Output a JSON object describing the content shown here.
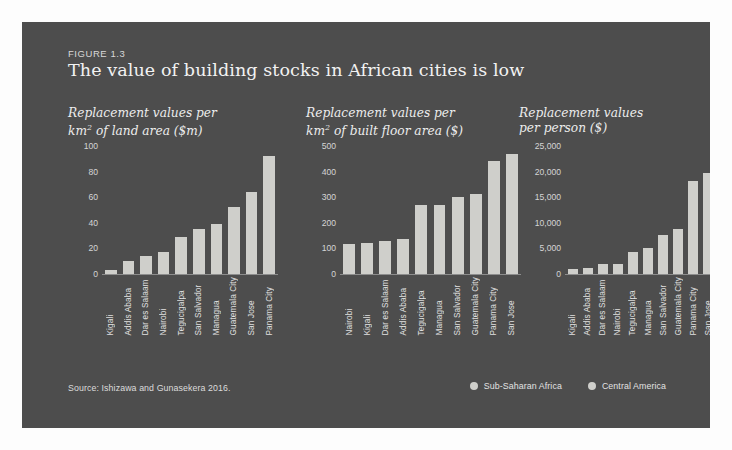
{
  "figure": {
    "label": "FIGURE 1.3",
    "title": "The value of building stocks in African cities is low",
    "source": "Source: Ishizawa and Gunasekera 2016.",
    "panel_color": "#4d4d4d",
    "bar_color": "#cfcfcb"
  },
  "legend": {
    "position": "bottom-right",
    "items": [
      {
        "label": "Sub-Saharan Africa",
        "color": "#cfcfcb"
      },
      {
        "label": "Central America",
        "color": "#cfcfcb"
      }
    ]
  },
  "chart_data": [
    {
      "type": "bar",
      "title": "Replacement values per km² of land area ($m)",
      "title_line1": "Replacement values per",
      "title_line2_pre": "km",
      "title_line2_sup": "2",
      "title_line2_post": " of land area ($m)",
      "xlabel": "",
      "ylabel": "",
      "ylim": [
        0,
        100
      ],
      "yticks": [
        0,
        20,
        40,
        60,
        80,
        100
      ],
      "ytick_labels": [
        "0",
        "20",
        "40",
        "60",
        "80",
        "100"
      ],
      "grid": false,
      "categories": [
        "Kigali",
        "Addis Ababa",
        "Dar es Salaam",
        "Nairobi",
        "Tegucigalpa",
        "San Salvador",
        "Managua",
        "Guatemala City",
        "San Jose",
        "Panama City"
      ],
      "values": [
        3,
        10,
        14,
        17,
        29,
        35,
        39,
        52,
        64,
        92
      ],
      "regions": [
        "Sub-Saharan Africa",
        "Sub-Saharan Africa",
        "Sub-Saharan Africa",
        "Sub-Saharan Africa",
        "Central America",
        "Central America",
        "Central America",
        "Central America",
        "Central America",
        "Central America"
      ]
    },
    {
      "type": "bar",
      "title": "Replacement values per km² of built floor area ($)",
      "title_line1": "Replacement values per",
      "title_line2_pre": "km",
      "title_line2_sup": "2",
      "title_line2_post": " of built floor area ($)",
      "xlabel": "",
      "ylabel": "",
      "ylim": [
        0,
        500
      ],
      "yticks": [
        0,
        100,
        200,
        300,
        400,
        500
      ],
      "ytick_labels": [
        "0",
        "100",
        "200",
        "300",
        "400",
        "500"
      ],
      "grid": false,
      "categories": [
        "Nairobi",
        "Kigali",
        "Dar es Salaam",
        "Addis Ababa",
        "Tegucigalpa",
        "Managua",
        "San Salvador",
        "Guatemala City",
        "Panama City",
        "San Jose"
      ],
      "values": [
        118,
        120,
        130,
        137,
        268,
        270,
        300,
        313,
        440,
        468
      ],
      "regions": [
        "Sub-Saharan Africa",
        "Sub-Saharan Africa",
        "Sub-Saharan Africa",
        "Sub-Saharan Africa",
        "Central America",
        "Central America",
        "Central America",
        "Central America",
        "Central America",
        "Central America"
      ]
    },
    {
      "type": "bar",
      "title": "Replacement values per person ($)",
      "title_line1": "Replacement values",
      "title_line2_pre": "per person ($)",
      "title_line2_sup": "",
      "title_line2_post": "",
      "xlabel": "",
      "ylabel": "",
      "ylim": [
        0,
        25000
      ],
      "yticks": [
        0,
        5000,
        10000,
        15000,
        20000,
        25000
      ],
      "ytick_labels": [
        "0",
        "5,000",
        "10,000",
        "15,000",
        "20,000",
        "25,000"
      ],
      "grid": false,
      "categories": [
        "Kigali",
        "Addis Ababa",
        "Dar es Salaam",
        "Nairobi",
        "Tegucigalpa",
        "Managua",
        "San Salvador",
        "Guatemala City",
        "Panama City",
        "San Jose"
      ],
      "values": [
        1000,
        1200,
        1900,
        2000,
        4300,
        5000,
        7700,
        8800,
        18200,
        19700
      ],
      "regions": [
        "Sub-Saharan Africa",
        "Sub-Saharan Africa",
        "Sub-Saharan Africa",
        "Sub-Saharan Africa",
        "Central America",
        "Central America",
        "Central America",
        "Central America",
        "Central America",
        "Central America"
      ]
    }
  ]
}
